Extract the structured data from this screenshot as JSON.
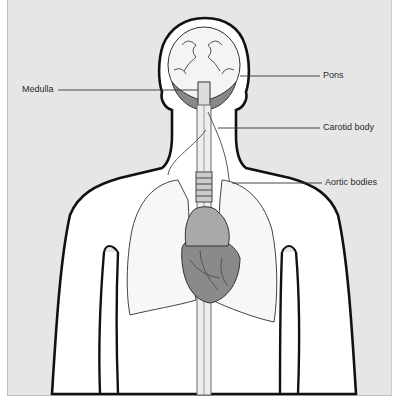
{
  "diagram": {
    "type": "anatomical-illustration",
    "labels": {
      "medulla": "Medulla",
      "pons": "Pons",
      "carotid_body": "Carotid body",
      "aortic_bodies": "Aortic bodies"
    },
    "colors": {
      "background": "#e6e6e6",
      "body_fill": "#ffffff",
      "outline": "#111111",
      "leader_line": "#333333"
    }
  }
}
